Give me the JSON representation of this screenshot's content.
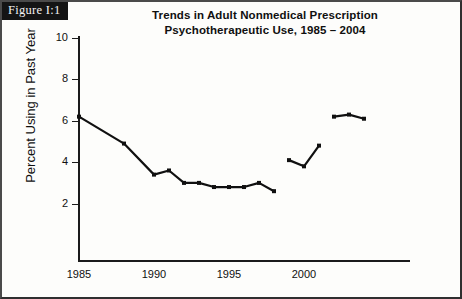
{
  "figure": {
    "banner_label": "Figure I:1"
  },
  "chart_data": {
    "type": "line",
    "title": "Trends in Adult Nonmedical Prescription Psychotherapeutic Use, 1985 – 2004",
    "title_line1": "Trends in Adult Nonmedical Prescription",
    "title_line2": "Psychotherapeutic Use, 1985 – 2004",
    "xlabel": "",
    "ylabel": "Percent Using in Past Year",
    "xlim": [
      1984,
      2005
    ],
    "ylim": [
      1.0,
      10.0
    ],
    "xticks": [
      1985,
      1990,
      1995,
      2000
    ],
    "yticks": [
      2,
      4,
      6,
      8,
      10
    ],
    "grid": false,
    "legend": "none",
    "line_color": "#101010",
    "marker": "square",
    "series": [
      {
        "name": "1985-1998 survey series",
        "x": [
          1985,
          1988,
          1990,
          1991,
          1992,
          1993,
          1994,
          1995,
          1996,
          1997,
          1998
        ],
        "values": [
          6.2,
          4.9,
          3.4,
          3.6,
          3.0,
          3.0,
          2.8,
          2.8,
          2.8,
          3.0,
          2.6
        ]
      },
      {
        "name": "1999-2001 survey series",
        "x": [
          1999,
          2000,
          2001
        ],
        "values": [
          4.1,
          3.8,
          4.8
        ]
      },
      {
        "name": "2002-2004 survey series",
        "x": [
          2002,
          2003,
          2004
        ],
        "values": [
          6.2,
          6.3,
          6.1
        ]
      }
    ]
  }
}
